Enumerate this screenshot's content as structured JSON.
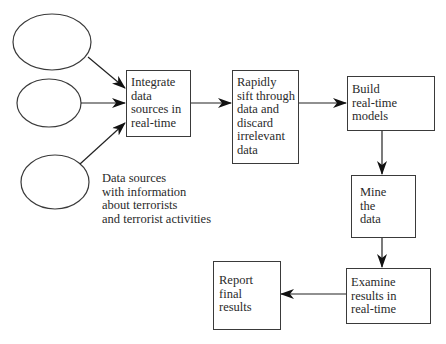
{
  "diagram": {
    "sources": {
      "count": 3,
      "caption_lines": [
        "Data sources",
        "with information",
        "about terrorists",
        "and terrorist activities"
      ]
    },
    "steps": [
      {
        "id": "integrate",
        "lines": [
          "Integrate",
          "data",
          "sources in",
          "real-time"
        ]
      },
      {
        "id": "sift",
        "lines": [
          "Rapidly",
          "sift through",
          "data and",
          "discard",
          "irrelevant",
          "data"
        ]
      },
      {
        "id": "build",
        "lines": [
          "Build",
          "real-time",
          "models"
        ]
      },
      {
        "id": "mine",
        "lines": [
          "Mine",
          "the",
          "data"
        ]
      },
      {
        "id": "examine",
        "lines": [
          "Examine",
          "results in",
          "real-time"
        ]
      },
      {
        "id": "report",
        "lines": [
          "Report",
          "final",
          "results"
        ]
      }
    ],
    "edges": [
      [
        "source-1",
        "integrate"
      ],
      [
        "source-2",
        "integrate"
      ],
      [
        "source-3",
        "integrate"
      ],
      [
        "integrate",
        "sift"
      ],
      [
        "sift",
        "build"
      ],
      [
        "build",
        "mine"
      ],
      [
        "mine",
        "examine"
      ],
      [
        "examine",
        "report"
      ]
    ],
    "colors": {
      "stroke": "#3a3a3a",
      "text": "#2a2a2a",
      "background": "#ffffff"
    }
  }
}
